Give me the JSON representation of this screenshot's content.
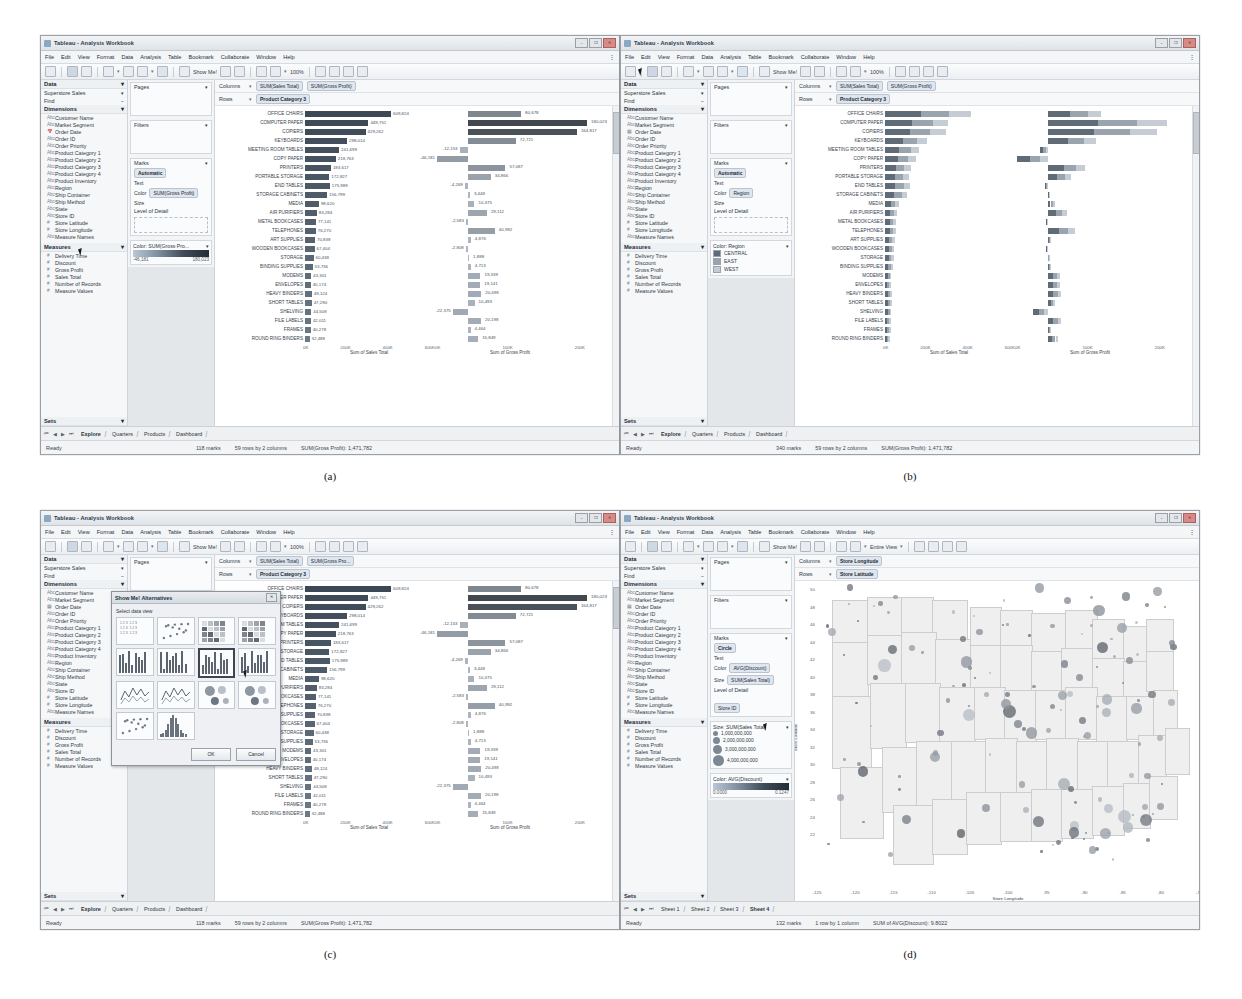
{
  "figure": {
    "captions": {
      "a": "(a)",
      "b": "(b)",
      "c": "(c)",
      "d": "(d)"
    }
  },
  "window": {
    "title": "Tableau - Analysis Workbook",
    "icon": "tableau-icon",
    "buttons": {
      "minimize": "–",
      "maximize": "❐",
      "close": "✕"
    },
    "menus": [
      "File",
      "Edit",
      "View",
      "Format",
      "Data",
      "Analysis",
      "Table",
      "Bookmark",
      "Collaborate",
      "Window",
      "Help"
    ]
  },
  "toolbar": {
    "show_me_label": "Show Me!",
    "zoom_label": "100%",
    "entire_view_label": "Entire View",
    "icons": [
      "undo-icon",
      "redo-icon",
      "save-icon",
      "new-sheet-icon",
      "duplicate-icon",
      "clear-icon",
      "swap-icon",
      "sort-asc-icon",
      "sort-desc-icon",
      "show-me-icon",
      "pin-icon",
      "refresh-icon",
      "group-icon",
      "labels-icon",
      "fit-icon",
      "highlight-icon",
      "zoom-in-icon",
      "zoom-out-icon",
      "pan-icon",
      "select-icon"
    ]
  },
  "data_pane": {
    "header": "Data",
    "datasource": "Superstore Sales",
    "find": "Find",
    "dimensions_header": "Dimensions",
    "dimensions": [
      {
        "icon": "abc-icon",
        "label": "Customer Name"
      },
      {
        "icon": "abc-icon",
        "label": "Market Segment"
      },
      {
        "icon": "calendar-icon",
        "label": "Order Date"
      },
      {
        "icon": "abc-icon",
        "label": "Order ID"
      },
      {
        "icon": "abc-icon",
        "label": "Order Priority"
      },
      {
        "icon": "abc-icon",
        "label": "Product Category 1"
      },
      {
        "icon": "abc-icon",
        "label": "Product Category 2"
      },
      {
        "icon": "abc-icon",
        "label": "Product Category 3"
      },
      {
        "icon": "abc-icon",
        "label": "Product Category 4"
      },
      {
        "icon": "abc-icon",
        "label": "Product Inventory"
      },
      {
        "icon": "abc-icon",
        "label": "Region"
      },
      {
        "icon": "abc-icon",
        "label": "Ship Container"
      },
      {
        "icon": "abc-icon",
        "label": "Ship Method"
      },
      {
        "icon": "abc-icon",
        "label": "State"
      },
      {
        "icon": "abc-icon",
        "label": "Store ID"
      },
      {
        "icon": "number-icon",
        "label": "Store Latitude"
      },
      {
        "icon": "number-icon",
        "label": "Store Longitude"
      },
      {
        "icon": "abc-icon",
        "label": "Measure Names"
      }
    ],
    "measures_header": "Measures",
    "measures": [
      {
        "icon": "number-icon",
        "label": "Delivery Time"
      },
      {
        "icon": "number-icon",
        "label": "Discount"
      },
      {
        "icon": "number-icon",
        "label": "Gross Profit"
      },
      {
        "icon": "number-icon",
        "label": "Sales Total"
      },
      {
        "icon": "number-icon",
        "label": "Number of Records"
      },
      {
        "icon": "number-icon",
        "label": "Measure Values"
      }
    ],
    "sets_header": "Sets"
  },
  "shelves": {
    "pages": "Pages",
    "filters": "Filters",
    "marks": "Marks",
    "mark_type": "Automatic",
    "mark_type_map": "Circle",
    "text": "Text",
    "color": "Color",
    "size": "Size",
    "level_of_detail": "Level of Detail",
    "columns": "Columns",
    "rows": "Rows"
  },
  "panels": {
    "a": {
      "columns_pills": [
        "SUM(Sales Total)",
        "SUM(Gross Profit)"
      ],
      "rows_pills": [
        "Product Category 3"
      ],
      "color_pill": "SUM(Gross Profit)",
      "color_legend_title": "Color: SUM(Gross Pro...",
      "color_legend_min": "-46,181",
      "color_legend_max": "180,023",
      "status": {
        "ready": "Ready",
        "marks": "118 marks",
        "rows_cols": "59 rows by 2 columns",
        "agg": "SUM(Gross Profit): 1,471,782"
      },
      "worksheet_tabs": [
        "Explore",
        "Quarters",
        "Products",
        "Dashboard"
      ],
      "active_tab": "Explore",
      "cursor_target": "dimension-region"
    },
    "b": {
      "columns_pills": [
        "SUM(Sales Total)",
        "SUM(Gross Profit)"
      ],
      "rows_pills": [
        "Product Category 3"
      ],
      "color_pill": "Region",
      "color_legend_title": "Color: Region",
      "color_legend_items": [
        {
          "label": "CENTRAL",
          "color": "#5f6b77"
        },
        {
          "label": "EAST",
          "color": "#9aa4ae"
        },
        {
          "label": "WEST",
          "color": "#c6ccd3"
        }
      ],
      "status": {
        "ready": "Ready",
        "marks": "340 marks",
        "rows_cols": "59 rows by 2 columns",
        "agg": "SUM(Gross Profit): 1,471,782"
      },
      "worksheet_tabs": [
        "Explore",
        "Quarters",
        "Products",
        "Dashboard"
      ],
      "active_tab": "Explore",
      "cursor_target": "toolbar-area"
    },
    "c": {
      "columns_pills": [
        "SUM(Sales Total)",
        "SUM(Gross Pro..."
      ],
      "rows_pills": [
        "Product Category 3"
      ],
      "color_pill": "Color",
      "dialog": {
        "title": "Show Me! Alternatives",
        "prompt": "Select data view",
        "ok": "OK",
        "cancel": "Cancel",
        "close_icon": "close-icon",
        "selected_thumb_index": 6,
        "thumbnails": [
          "text-table",
          "scatter-matrix",
          "heat-map",
          "highlight-table",
          "small-multiples-bar",
          "bar-chart",
          "bar-chart-selected",
          "stacked-bar",
          "line-chart",
          "area-chart",
          "pie-chart",
          "bubble-chart",
          "scatter-plot",
          "histogram"
        ]
      },
      "status": {
        "ready": "Ready",
        "marks": "118 marks",
        "rows_cols": "59 rows by 2 columns",
        "agg": "SUM(Gross Profit): 1,471,782"
      },
      "worksheet_tabs": [
        "Explore",
        "Quarters",
        "Products",
        "Dashboard"
      ],
      "active_tab": "Explore"
    },
    "d": {
      "columns_pills": [
        "Store Longitude"
      ],
      "rows_pills": [
        "Store Latitude"
      ],
      "mark_type": "Circle",
      "color_pill": "AVG(Discount)",
      "size_pill": "SUM(Sales Total)",
      "lod_pill": "Store ID",
      "size_legend_title": "Size: SUM(Sales Total)",
      "size_legend_items": [
        "1,000,000,000",
        "2,000,000,000",
        "3,000,000,000",
        "4,000,000,000"
      ],
      "color_legend_title": "Color: AVG(Discount)",
      "color_legend_min": "0.0000",
      "color_legend_max": "0.1247",
      "status": {
        "ready": "Ready",
        "marks": "132 marks",
        "rows_cols": "1 row by 1 column",
        "agg": "SUM of AVG(Discount): 9.8022"
      },
      "worksheet_tabs": [
        "Sheet 1",
        "Sheet 2",
        "Sheet 3",
        "Sheet 4"
      ],
      "active_tab": "Sheet 4",
      "entire_view": "Entire View"
    }
  },
  "chart_data": [
    {
      "id": "panel-a-sales",
      "type": "bar",
      "title": "",
      "xlabel": "Sum of Sales Total",
      "ylabel": "Product Category 3",
      "xticks": [
        "0K",
        "200K",
        "400K",
        "600K"
      ],
      "xlim": [
        0,
        700000
      ],
      "grid": false,
      "categories": [
        "OFFICE CHAIRS",
        "COMPUTER PAPER",
        "COPIERS",
        "KEYBOARDS",
        "MEETING ROOM TABLES",
        "COPY PAPER",
        "PRINTERS",
        "PORTABLE STORAGE",
        "END TABLES",
        "STORAGE CABINETS",
        "MEDIA",
        "AIR PURIFIERS",
        "METAL BOOKCASES",
        "TELEPHONES",
        "ART SUPPLIES",
        "WOODEN BOOKCASES",
        "STORAGE",
        "BINDING SUPPLIES",
        "MODEMS",
        "ENVELOPES",
        "HEAVY BINDERS",
        "SHORT TABLES",
        "SHELVING",
        "FILE LABELS",
        "FRAMES",
        "ROUND RING BINDERS"
      ],
      "values": [
        609824,
        449751,
        429262,
        298014,
        241699,
        218763,
        183617,
        172827,
        175989,
        156799,
        98620,
        83284,
        77141,
        76270,
        70838,
        67404,
        60438,
        53736,
        43301,
        40174,
        48124,
        47290,
        44508,
        42011,
        40278,
        32488
      ],
      "value_labels": [
        "609,824",
        "449,751",
        "429,262",
        "298,014",
        "241,699",
        "218,763",
        "183,617",
        "172,827",
        "175,989",
        "156,799",
        "98,620",
        "83,284",
        "77,141",
        "76,270",
        "70,838",
        "67,404",
        "60,438",
        "53,736",
        "43,301",
        "40,174",
        "48,124",
        "47,290",
        "44,508",
        "42,011",
        "40,278",
        "32,488"
      ]
    },
    {
      "id": "panel-a-profit",
      "type": "bar",
      "title": "",
      "xlabel": "Sum of Gross Profit",
      "ylabel": "Product Category 3",
      "xticks": [
        "0K",
        "100K",
        "200K"
      ],
      "xlim": [
        -60000,
        200000
      ],
      "grid": false,
      "categories": [
        "OFFICE CHAIRS",
        "COMPUTER PAPER",
        "COPIERS",
        "KEYBOARDS",
        "MEETING ROOM TABLES",
        "COPY PAPER",
        "PRINTERS",
        "PORTABLE STORAGE",
        "END TABLES",
        "STORAGE CABINETS",
        "MEDIA",
        "AIR PURIFIERS",
        "METAL BOOKCASES",
        "TELEPHONES",
        "ART SUPPLIES",
        "WOODEN BOOKCASES",
        "STORAGE",
        "BINDING SUPPLIES",
        "MODEMS",
        "ENVELOPES",
        "HEAVY BINDERS",
        "SHORT TABLES",
        "SHELVING",
        "FILE LABELS",
        "FRAMES",
        "ROUND RING BINDERS"
      ],
      "values": [
        80678,
        180023,
        164817,
        72721,
        -12153,
        -46181,
        57087,
        34866,
        -4269,
        3448,
        10375,
        29112,
        -2583,
        40992,
        4876,
        -2808,
        1888,
        4713,
        19339,
        19141,
        20498,
        10493,
        -22375,
        20198,
        4464,
        15849
      ],
      "value_labels": [
        "80,678",
        "180,023",
        "164,817",
        "72,721",
        "-12,153",
        "-46,181",
        "57,087",
        "34,866",
        "-4,269",
        "3,448",
        "10,375",
        "29,112",
        "-2,583",
        "40,992",
        "4,876",
        "-2,808",
        "1,888",
        "4,713",
        "19,339",
        "19,141",
        "20,498",
        "10,493",
        "-22,375",
        "20,198",
        "4,464",
        "15,849"
      ]
    },
    {
      "id": "panel-d-map",
      "type": "scatter",
      "title": "",
      "xlabel": "Store Longitude",
      "ylabel": "Store Latitude",
      "xticks": [
        "-125",
        "-120",
        "-115",
        "-110",
        "-105",
        "-100",
        "-95",
        "-90",
        "-85",
        "-80",
        "-75"
      ],
      "yticks": [
        "50",
        "48",
        "46",
        "44",
        "42",
        "40",
        "38",
        "36",
        "34",
        "32",
        "30",
        "28",
        "26",
        "24",
        "22"
      ],
      "xlim": [
        -126,
        -72
      ],
      "ylim": [
        22,
        51
      ],
      "grid": false,
      "size_encoding": "SUM(Sales Total)",
      "color_encoding": "AVG(Discount)",
      "marks": 132
    }
  ]
}
